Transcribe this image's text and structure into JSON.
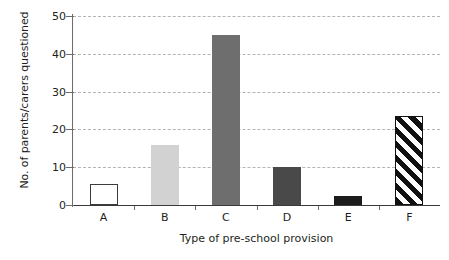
{
  "chart_data": {
    "type": "bar",
    "title": "",
    "xlabel": "Type of pre-school provision",
    "ylabel": "No. of parents/carers questioned",
    "categories": [
      "A",
      "B",
      "C",
      "D",
      "E",
      "F"
    ],
    "values": [
      5.5,
      16,
      45,
      10,
      2.5,
      23.5
    ],
    "ylim": [
      0,
      50
    ],
    "ytick_labels": [
      "0",
      "10",
      "20",
      "30",
      "40",
      "50"
    ],
    "ytick_values": [
      0,
      10,
      20,
      30,
      40,
      50
    ],
    "grid": "horizontal-dashed",
    "legend": "none",
    "series": [
      {
        "name": "No. of parents/carers questioned",
        "values": [
          5.5,
          16,
          45,
          10,
          2.5,
          23.5
        ]
      }
    ],
    "bar_styles": [
      "fill-white",
      "fill-lightgray",
      "fill-midgray",
      "fill-darkgray",
      "fill-black",
      "fill-hatch"
    ],
    "colors": {
      "bar_a": "#ffffff",
      "bar_b": "#d2d2d2",
      "bar_c": "#6e6e6e",
      "bar_d": "#494949",
      "bar_e": "#1c1c1c",
      "bar_f_stripes": "#111111",
      "gridline": "#b4b4b4",
      "axis": "#3a3a3a",
      "text": "#231f20",
      "background": "#ffffff"
    }
  }
}
